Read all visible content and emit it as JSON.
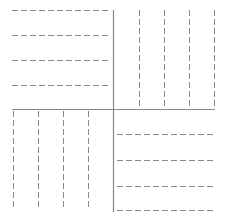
{
  "diagram": {
    "colors": {
      "solid_line": "#888888",
      "dashed_line": "#8a8a8a",
      "background": "#ffffff"
    },
    "dividers": {
      "vertical": {
        "x": 113,
        "y1": 10,
        "y2": 212
      },
      "horizontal": {
        "y": 109,
        "x1": 12,
        "x2": 215
      }
    },
    "quadrants": [
      {
        "id": "top-left",
        "orientation": "horizontal",
        "positions": [
          10,
          35,
          60,
          85
        ],
        "span": [
          12,
          111
        ]
      },
      {
        "id": "top-right",
        "orientation": "vertical",
        "positions": [
          139,
          164,
          189,
          214
        ],
        "span": [
          10,
          107
        ]
      },
      {
        "id": "bottom-left",
        "orientation": "vertical",
        "positions": [
          13,
          38,
          63,
          88
        ],
        "span": [
          111,
          210
        ]
      },
      {
        "id": "bottom-right",
        "orientation": "horizontal",
        "positions": [
          134,
          160,
          186,
          210
        ],
        "span": [
          117,
          216
        ]
      }
    ]
  }
}
